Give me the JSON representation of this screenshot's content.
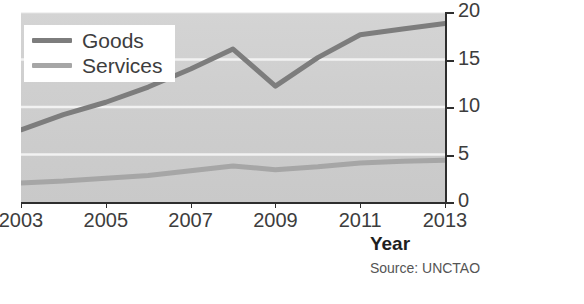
{
  "chart_data": {
    "type": "line",
    "title": "",
    "subtitle": "",
    "xlabel": "Year",
    "ylabel": "US$ trillion",
    "x": [
      2003,
      2004,
      2005,
      2006,
      2007,
      2008,
      2009,
      2010,
      2011,
      2012,
      2013
    ],
    "xlim": [
      2003,
      2013
    ],
    "ylim": [
      0,
      20
    ],
    "xticks": [
      2003,
      2005,
      2007,
      2009,
      2011,
      2013
    ],
    "xtick_labels": [
      "2003",
      "2005",
      "2007",
      "2009",
      "2011",
      "2013"
    ],
    "yticks": [
      0,
      5,
      10,
      15,
      20
    ],
    "ytick_labels": [
      "0",
      "5",
      "10",
      "15",
      "20"
    ],
    "y_axis_position": "right",
    "grid": "horizontal-white",
    "legend_position": "top-left",
    "plot_background": "#cfcfcf",
    "series": [
      {
        "name": "Goods",
        "color": "#7d7d7d",
        "values": [
          7.6,
          9.2,
          10.5,
          12.1,
          14.0,
          16.1,
          12.2,
          15.2,
          17.6,
          18.2,
          18.8
        ]
      },
      {
        "name": "Services",
        "color": "#a6a6a6",
        "values": [
          2.0,
          2.2,
          2.5,
          2.8,
          3.3,
          3.8,
          3.4,
          3.7,
          4.1,
          4.3,
          4.4
        ]
      }
    ],
    "annotations": [
      "Source: UNCTAO"
    ]
  },
  "legend": {
    "items": [
      {
        "label": "Goods",
        "color": "#7d7d7d"
      },
      {
        "label": "Services",
        "color": "#a6a6a6"
      }
    ]
  },
  "axes": {
    "x_title": "Year",
    "y_title": "US$ trillion",
    "x_tick_labels": [
      "2003",
      "2005",
      "2007",
      "2009",
      "2011",
      "2013"
    ],
    "y_tick_labels": [
      "0",
      "5",
      "10",
      "15",
      "20"
    ]
  },
  "footer": {
    "source": "Source: UNCTAO"
  },
  "colors": {
    "goods": "#7d7d7d",
    "services": "#a6a6a6",
    "plot_bg": "#cfcfcf",
    "gridline": "#f2f2f2",
    "axis": "#2e2e2e",
    "text": "#3d3d3d"
  }
}
